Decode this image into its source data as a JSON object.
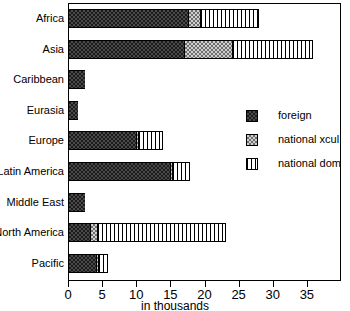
{
  "chart_data": {
    "type": "bar",
    "orientation": "horizontal",
    "stacked": true,
    "title": "",
    "xlabel": "in thousands",
    "ylabel": "",
    "xlim": [
      0,
      40
    ],
    "xticks": [
      0,
      5,
      10,
      15,
      20,
      25,
      30,
      35
    ],
    "xtick_labels": [
      "0",
      "5",
      "10",
      "15",
      "20",
      "25",
      "30",
      "35"
    ],
    "grid": false,
    "legend_position": "center-right",
    "categories": [
      "Africa",
      "Asia",
      "Caribbean",
      "Eurasia",
      "Europe",
      "Latin America",
      "Middle East",
      "North America",
      "Pacific"
    ],
    "series": [
      {
        "name": "foreign",
        "pattern": "dark-checker",
        "values": [
          17.6,
          17.0,
          2.5,
          1.5,
          9.9,
          15.0,
          2.5,
          3.2,
          4.1
        ]
      },
      {
        "name": "national xcul",
        "pattern": "light-checker",
        "values": [
          1.8,
          7.0,
          0.0,
          0.0,
          0.3,
          0.3,
          0.0,
          1.0,
          0.3
        ]
      },
      {
        "name": "national dom",
        "pattern": "vertical-hatch",
        "values": [
          8.6,
          11.9,
          0.0,
          0.0,
          3.7,
          2.6,
          0.0,
          19.0,
          1.5
        ]
      }
    ],
    "totals": [
      28.0,
      35.9,
      2.5,
      1.5,
      13.9,
      17.9,
      2.5,
      23.2,
      5.9
    ]
  },
  "legend": {
    "items": [
      {
        "label": "foreign"
      },
      {
        "label": "national xcul"
      },
      {
        "label": "national dom"
      }
    ]
  },
  "colors": {
    "foreign": "#1b1b1b",
    "national_xcul": "#cfcfcf",
    "national_dom": "#ffffff",
    "axis": "#000000",
    "background": "#ffffff"
  }
}
